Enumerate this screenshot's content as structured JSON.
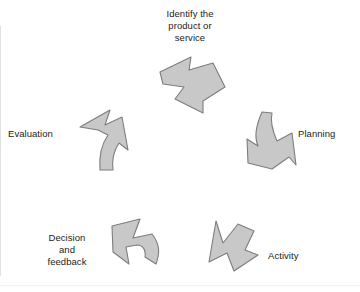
{
  "diagram": {
    "type": "cyclical-process",
    "direction": "clockwise",
    "background_color": "#ffffff",
    "arrow_fill": "#c8c8c8",
    "arrow_stroke": "#808080",
    "text_color": "#1c1c1c",
    "stages": [
      {
        "id": "identify",
        "label": "Identify the\nproduct or\nservice",
        "arrow_name": "arrow-identify",
        "arrow_direction": "right",
        "label_position": "above"
      },
      {
        "id": "planning",
        "label": "Planning",
        "arrow_name": "arrow-planning",
        "arrow_direction": "down",
        "label_position": "right"
      },
      {
        "id": "activity",
        "label": "Activity",
        "arrow_name": "arrow-activity",
        "arrow_direction": "down-left",
        "label_position": "right"
      },
      {
        "id": "decision",
        "label": "Decision\nand\nfeedback",
        "arrow_name": "arrow-decision",
        "arrow_direction": "up-left",
        "label_position": "left"
      },
      {
        "id": "evaluation",
        "label": "Evaluation",
        "arrow_name": "arrow-evaluation",
        "arrow_direction": "up-right",
        "label_position": "left"
      }
    ]
  }
}
